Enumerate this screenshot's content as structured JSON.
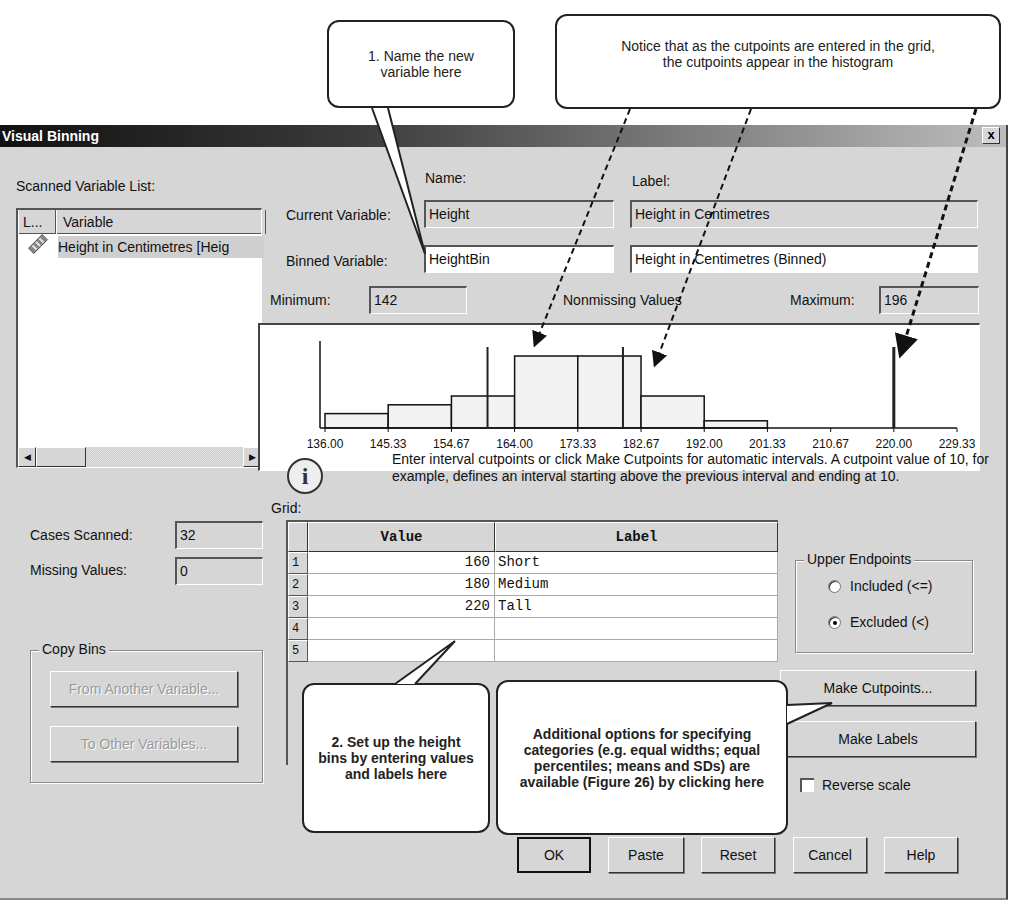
{
  "callouts": {
    "name_variable": "1. Name the new variable here",
    "cutpoints_notice": "Notice that as the cutpoints are entered in the grid, the cutpoints appear in the histogram",
    "setup_bins": "2. Set up the height bins by entering values and labels here",
    "additional_options": "Additional options for specifying categories (e.g. equal widths; equal percentiles; means and SDs) are available (Figure 26) by clicking here"
  },
  "dialog": {
    "title": "Visual Binning",
    "close_label": "x"
  },
  "left_panel": {
    "scanned_list_label": "Scanned Variable List:",
    "columns": [
      "L...",
      "Variable"
    ],
    "variables": [
      {
        "icon": "scale-ruler-icon",
        "name": "Height in Centimetres [Heig"
      }
    ],
    "cases_scanned_label": "Cases Scanned:",
    "cases_scanned": "32",
    "missing_values_label": "Missing Values:",
    "missing_values": "0",
    "copy_bins": {
      "title": "Copy Bins",
      "from_another": "From Another Variable...",
      "to_other": "To Other Variables..."
    }
  },
  "variables": {
    "name_header": "Name:",
    "label_header": "Label:",
    "current_label": "Current Variable:",
    "current_name": "Height",
    "current_var_label": "Height in Centimetres",
    "binned_label": "Binned Variable:",
    "binned_name": "HeightBin",
    "binned_var_label": "Height in Centimetres (Binned)"
  },
  "stats": {
    "minimum_label": "Minimum:",
    "minimum": "142",
    "nonmissing_label": "Nonmissing Values",
    "maximum_label": "Maximum:",
    "maximum": "196"
  },
  "histogram": {
    "x_ticks": [
      "136.00",
      "145.33",
      "154.67",
      "164.00",
      "173.33",
      "182.67",
      "192.00",
      "201.33",
      "210.67",
      "220.00",
      "229.33"
    ],
    "x_range": [
      136.0,
      229.33
    ],
    "bins": [
      {
        "start": 136.0,
        "end": 145.33,
        "rel_height": 0.18
      },
      {
        "start": 145.33,
        "end": 154.67,
        "rel_height": 0.29
      },
      {
        "start": 154.67,
        "end": 164.0,
        "rel_height": 0.4
      },
      {
        "start": 164.0,
        "end": 173.33,
        "rel_height": 0.9
      },
      {
        "start": 173.33,
        "end": 182.67,
        "rel_height": 0.9
      },
      {
        "start": 182.67,
        "end": 192.0,
        "rel_height": 0.4
      },
      {
        "start": 192.0,
        "end": 201.33,
        "rel_height": 0.09
      }
    ],
    "cutpoints": [
      160,
      180,
      220
    ]
  },
  "grid": {
    "label": "Grid:",
    "info_text": "Enter interval cutpoints or click Make Cutpoints for automatic intervals.  A cutpoint value of 10, for example, defines an interval starting above the previous interval and ending at 10.",
    "columns": [
      "Value",
      "Label"
    ],
    "rows": [
      {
        "num": "1",
        "value": "160",
        "label": "Short"
      },
      {
        "num": "2",
        "value": "180",
        "label": "Medium"
      },
      {
        "num": "3",
        "value": "220",
        "label": "Tall"
      },
      {
        "num": "4",
        "value": "",
        "label": ""
      },
      {
        "num": "5",
        "value": "",
        "label": ""
      }
    ]
  },
  "upper_endpoints": {
    "title": "Upper Endpoints",
    "included": "Included (<=)",
    "excluded": "Excluded (<)",
    "selected": "excluded"
  },
  "buttons": {
    "make_cutpoints": "Make Cutpoints...",
    "make_labels": "Make Labels",
    "reverse_scale": "Reverse scale",
    "ok": "OK",
    "paste": "Paste",
    "reset": "Reset",
    "cancel": "Cancel",
    "help": "Help"
  }
}
